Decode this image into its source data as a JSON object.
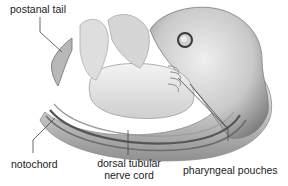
{
  "diagram": {
    "labels": {
      "postanal_tail": "postanal tail",
      "notochord": "notochord",
      "nerve_cord_line1": "dorsal tubular",
      "nerve_cord_line2": "nerve cord",
      "pharyngeal_pouches": "pharyngeal pouches"
    },
    "colors": {
      "background": "#ffffff",
      "body_light": "#e6e6e6",
      "body_mid": "#bdbdbd",
      "body_dark": "#8a8a8a",
      "leader_line": "#444444",
      "text": "#222222"
    }
  }
}
